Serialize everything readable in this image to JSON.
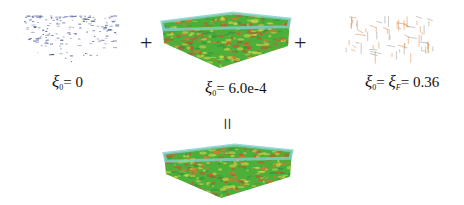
{
  "panels": [
    {
      "id": "scatter-blue",
      "label": {
        "symbol": "ξ",
        "sub": "0",
        "eq": "= 0"
      }
    },
    {
      "id": "dense-block",
      "label": {
        "symbol": "ξ",
        "sub": "0",
        "eq": "= 6.0e-4"
      }
    },
    {
      "id": "sparse-orange",
      "label": {
        "symbol": "ξ",
        "sub": "0",
        "mid": "= ",
        "symbol2": "ξ",
        "sub2": "F",
        "eq": "= 0.36"
      }
    }
  ],
  "operators": {
    "plus1": "+",
    "plus2": "+",
    "equals": "="
  },
  "colors": {
    "blue_points": "#3a4a8a",
    "block_green": "#4caf3a",
    "block_red": "#e0452a",
    "block_yellow": "#e8d84a",
    "block_cyan": "#7fd1c8",
    "sparse_orange": "#e09050",
    "sparse_gray": "#9aa0a0"
  }
}
